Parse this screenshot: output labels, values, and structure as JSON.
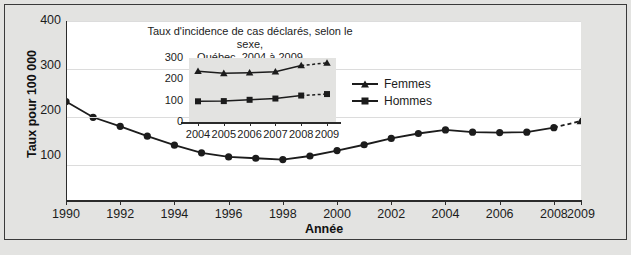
{
  "figure": {
    "x_axis_title": "Année",
    "y_axis_title": "Taux pour 100 000"
  },
  "inset": {
    "title_line1": "Taux d'incidence de cas déclarés, selon le sexe,",
    "title_line2": "Québec, 2004 à 2009"
  },
  "legend": {
    "items": [
      {
        "label": "Femmes",
        "marker": "triangle-marker"
      },
      {
        "label": "Hommes",
        "marker": "square-marker"
      }
    ]
  },
  "colors": {
    "line": "#1c1c1c",
    "page_background": "#e3e3e1",
    "plot_background": "#ffffff",
    "gridline": "#dcdcdc",
    "axis": "#2b2b2b"
  },
  "chart_data": [
    {
      "type": "line",
      "name": "main-chart",
      "title": "",
      "xlabel": "Année",
      "ylabel": "Taux pour 100 000",
      "xlim": [
        1990,
        2009
      ],
      "ylim": [
        0,
        400
      ],
      "yticks": [
        100,
        200,
        300,
        400
      ],
      "xticks": [
        1990,
        1992,
        1994,
        1996,
        1998,
        2000,
        2002,
        2004,
        2006,
        2008,
        2009
      ],
      "grid": true,
      "legend": "none",
      "series": [
        {
          "name": "Taux global",
          "marker": "circle",
          "x": [
            1990,
            1991,
            1992,
            1993,
            1994,
            1995,
            1996,
            1997,
            1998,
            1999,
            2000,
            2001,
            2002,
            2003,
            2004,
            2005,
            2006,
            2007,
            2008,
            2009
          ],
          "values": [
            221,
            186,
            166,
            144,
            124,
            107,
            98,
            95,
            92,
            100,
            112,
            125,
            139,
            150,
            158,
            153,
            152,
            153,
            163,
            178
          ],
          "dashed_from": 2008,
          "dashed_marker": "triangle"
        }
      ]
    },
    {
      "type": "line",
      "name": "inset-chart",
      "title": "Taux d'incidence de cas déclarés, selon le sexe, Québec, 2004 à 2009",
      "xlabel": "",
      "ylabel": "",
      "xlim": [
        2004,
        2009
      ],
      "ylim": [
        0,
        300
      ],
      "yticks": [
        0,
        100,
        200,
        300
      ],
      "xticks": [
        2004,
        2005,
        2006,
        2007,
        2008,
        2009
      ],
      "grid": false,
      "legend": "right",
      "series": [
        {
          "name": "Femmes",
          "marker": "triangle",
          "x": [
            2004,
            2005,
            2006,
            2007,
            2008,
            2009
          ],
          "values": [
            238,
            228,
            231,
            236,
            265,
            277
          ],
          "dashed_from": 2008
        },
        {
          "name": "Hommes",
          "marker": "square",
          "x": [
            2004,
            2005,
            2006,
            2007,
            2008,
            2009
          ],
          "values": [
            97,
            98,
            104,
            110,
            124,
            131
          ],
          "dashed_from": 2008
        }
      ]
    }
  ]
}
